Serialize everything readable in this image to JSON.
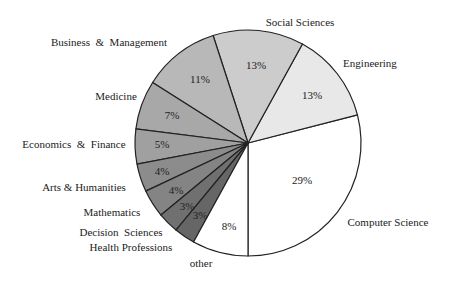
{
  "chart_data": {
    "type": "pie",
    "title": "",
    "center": [
      248,
      143
    ],
    "radius": 113,
    "start_angle_deg": 0,
    "direction": "clockwise_from_top_slices_listed_from_other",
    "slices": [
      {
        "label": "Computer Science",
        "value": 29,
        "pct_label": "29%",
        "color": "#ffffff",
        "label_pos": [
          388,
          226
        ],
        "label_anchor": "middle",
        "pct_pos": [
          302,
          184
        ]
      },
      {
        "label": "Engineering",
        "value": 13,
        "pct_label": "13%",
        "color": "#e8e8e8",
        "label_pos": [
          370,
          67
        ],
        "label_anchor": "middle",
        "pct_pos": [
          312,
          99
        ]
      },
      {
        "label": "Social Sciences",
        "value": 13,
        "pct_label": "13%",
        "color": "#cccccc",
        "label_pos": [
          300,
          26
        ],
        "label_anchor": "middle",
        "pct_pos": [
          256,
          69
        ]
      },
      {
        "label": "Business  &  Management",
        "value": 11,
        "pct_label": "11%",
        "color": "#b8b8b8",
        "label_pos": [
          109,
          46
        ],
        "label_anchor": "middle",
        "pct_pos": [
          200,
          83
        ]
      },
      {
        "label": "Medicine",
        "value": 7,
        "pct_label": "7%",
        "color": "#a8a8a8",
        "label_pos": [
          116,
          100
        ],
        "label_anchor": "middle",
        "pct_pos": [
          172,
          119
        ]
      },
      {
        "label": "Economics  &  Finance",
        "value": 5,
        "pct_label": "5%",
        "color": "#a0a0a0",
        "label_pos": [
          74,
          148
        ],
        "label_anchor": "middle",
        "pct_pos": [
          162,
          148
        ]
      },
      {
        "label": "Arts & Humanities",
        "value": 4,
        "pct_label": "4%",
        "color": "#8c8c8c",
        "label_pos": [
          84,
          191
        ],
        "label_anchor": "middle",
        "pct_pos": [
          162,
          175
        ]
      },
      {
        "label": "Mathematics",
        "value": 4,
        "pct_label": "4%",
        "color": "#848484",
        "label_pos": [
          112,
          216
        ],
        "label_anchor": "middle",
        "pct_pos": [
          176,
          194
        ]
      },
      {
        "label": "Decision  Sciences",
        "value": 3,
        "pct_label": "3%",
        "color": "#707070",
        "label_pos": [
          121,
          236
        ],
        "label_anchor": "middle",
        "pct_pos": [
          187,
          210
        ]
      },
      {
        "label": "Health Professions",
        "value": 3,
        "pct_label": "3%",
        "color": "#666666",
        "label_pos": [
          131,
          251
        ],
        "label_anchor": "middle",
        "pct_pos": [
          200,
          219
        ]
      },
      {
        "label": "other",
        "value": 8,
        "pct_label": "8%",
        "color": "#ffffff",
        "label_pos": [
          201,
          267
        ],
        "label_anchor": "middle",
        "pct_pos": [
          229,
          230
        ]
      }
    ],
    "legend": "none",
    "grid": false
  }
}
